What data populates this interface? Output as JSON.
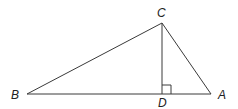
{
  "diagram": {
    "type": "right-triangle-with-altitude",
    "colors": {
      "line": "#3a3a3a",
      "label": "#222222",
      "background": "#ffffff"
    },
    "points": {
      "A": {
        "label": "A",
        "x": 211,
        "y": 94
      },
      "B": {
        "label": "B",
        "x": 27,
        "y": 94
      },
      "C": {
        "label": "C",
        "x": 162,
        "y": 23
      },
      "D": {
        "label": "D",
        "x": 162,
        "y": 94
      }
    },
    "segments": [
      "BA",
      "BC",
      "CA",
      "CD"
    ],
    "right_angle_marker": {
      "at": "D",
      "size": 9
    }
  }
}
